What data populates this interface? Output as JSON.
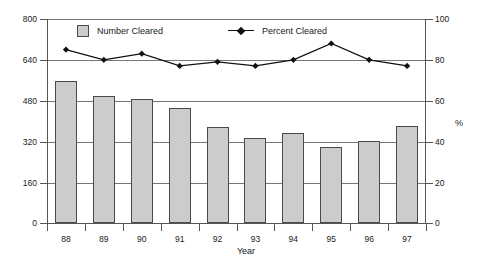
{
  "chart_data": {
    "type": "bar",
    "title": "",
    "xlabel": "Year",
    "ylabel": "",
    "ylabel_right": "%",
    "categories": [
      "88",
      "89",
      "90",
      "91",
      "92",
      "93",
      "94",
      "95",
      "96",
      "97"
    ],
    "ylim": [
      0,
      800
    ],
    "ylim_right": [
      0,
      100
    ],
    "yticks": [
      "0",
      "160",
      "320",
      "480",
      "640",
      "800"
    ],
    "yticks_right": [
      "0",
      "20",
      "40",
      "60",
      "80",
      "100"
    ],
    "grid": true,
    "legend_position": "top-inside",
    "series": [
      {
        "name": "Number Cleared",
        "kind": "bar",
        "axis": "left",
        "color": "#cccccc",
        "values": [
          555,
          500,
          487,
          450,
          378,
          333,
          352,
          298,
          320,
          380
        ]
      },
      {
        "name": "Percent Cleared",
        "kind": "line",
        "axis": "right",
        "color": "#111111",
        "marker": "diamond",
        "values": [
          85,
          80,
          83,
          77,
          79,
          77,
          80,
          88,
          80,
          77
        ]
      }
    ]
  },
  "legend": {
    "bar_label": "Number Cleared",
    "line_label": "Percent Cleared"
  },
  "axes": {
    "x_title": "Year",
    "right_title": "%"
  }
}
